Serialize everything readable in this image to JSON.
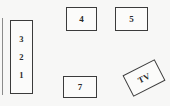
{
  "diagram": {
    "type": "floor-plan",
    "background_color": "#f7f7f6",
    "stroke_color": "#3b3b3b",
    "wall": {
      "name": "left-wall-line",
      "color": "#8a8a8a"
    },
    "items": [
      {
        "id": "seat-stack",
        "shape": "rectangle",
        "orientation": "vertical",
        "labels": [
          "3",
          "2",
          "1"
        ]
      },
      {
        "id": "box-4",
        "shape": "rectangle",
        "orientation": "horizontal",
        "label": "4"
      },
      {
        "id": "box-5",
        "shape": "rectangle",
        "orientation": "horizontal",
        "label": "5"
      },
      {
        "id": "box-7",
        "shape": "rectangle",
        "orientation": "horizontal",
        "label": "7"
      },
      {
        "id": "box-tv",
        "shape": "rectangle",
        "orientation": "rotated",
        "rotation_degrees": -27,
        "label": "TV"
      }
    ]
  },
  "labels": {
    "seat_3": "3",
    "seat_2": "2",
    "seat_1": "1",
    "box_4": "4",
    "box_5": "5",
    "box_7": "7",
    "tv": "TV"
  }
}
